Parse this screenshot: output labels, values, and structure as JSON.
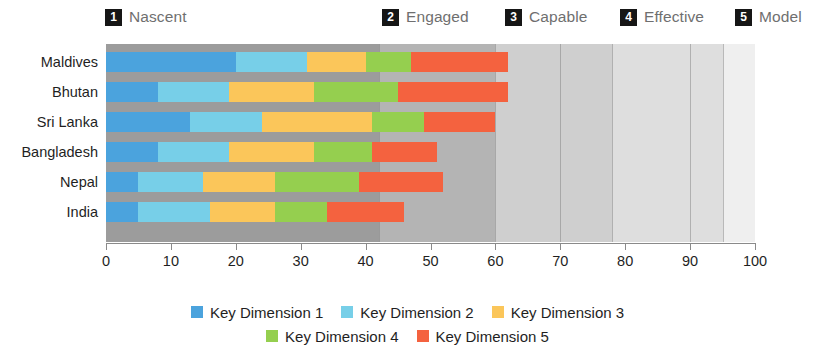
{
  "bands": [
    {
      "number": "1",
      "label": "Nascent",
      "x_px": 105
    },
    {
      "number": "2",
      "label": "Engaged",
      "x_px": 382
    },
    {
      "number": "3",
      "label": "Capable",
      "x_px": 505
    },
    {
      "number": "4",
      "label": "Effective",
      "x_px": 620
    },
    {
      "number": "5",
      "label": "Model",
      "x_px": 735
    }
  ],
  "legend": {
    "row1": [
      {
        "label": "Key Dimension 1",
        "color": "#4ba3dd"
      },
      {
        "label": "Key Dimension 2",
        "color": "#77cfe8"
      },
      {
        "label": "Key Dimension 3",
        "color": "#fbc65a"
      }
    ],
    "row2": [
      {
        "label": "Key Dimension 4",
        "color": "#95cf4f"
      },
      {
        "label": "Key Dimension 5",
        "color": "#f4623f"
      }
    ]
  },
  "chart_data": {
    "type": "bar",
    "orientation": "horizontal",
    "stacked": true,
    "title": "",
    "xlabel": "",
    "ylabel": "",
    "xlim": [
      0,
      100
    ],
    "xticks": [
      0,
      10,
      20,
      30,
      40,
      50,
      60,
      70,
      80,
      90,
      100
    ],
    "grid": false,
    "legend_position": "bottom",
    "categories": [
      "Maldives",
      "Bhutan",
      "Sri Lanka",
      "Bangladesh",
      "Nepal",
      "India"
    ],
    "series": [
      {
        "name": "Key Dimension 1",
        "color": "#4ba3dd",
        "values": [
          20,
          8,
          13,
          8,
          5,
          5
        ]
      },
      {
        "name": "Key Dimension 2",
        "color": "#77cfe8",
        "values": [
          11,
          11,
          11,
          11,
          10,
          11
        ]
      },
      {
        "name": "Key Dimension 3",
        "color": "#fbc65a",
        "values": [
          9,
          13,
          17,
          13,
          11,
          10
        ]
      },
      {
        "name": "Key Dimension 4",
        "color": "#95cf4f",
        "values": [
          7,
          13,
          8,
          9,
          13,
          8
        ]
      },
      {
        "name": "Key Dimension 5",
        "color": "#f4623f",
        "values": [
          15,
          17,
          11,
          10,
          13,
          12
        ]
      }
    ],
    "totals": [
      62,
      62,
      60,
      51,
      52,
      46
    ],
    "background_zones": [
      {
        "band": "1",
        "label": "Nascent",
        "from": 0,
        "to": 42,
        "color": "#9c9c9c"
      },
      {
        "band": "2",
        "label": "Engaged",
        "from": 42,
        "to": 60,
        "color": "#b4b4b4"
      },
      {
        "band": "3",
        "label": "Capable",
        "from": 60,
        "to": 78,
        "color": "#cfcfcf"
      },
      {
        "band": "4",
        "label": "Effective",
        "from": 78,
        "to": 95,
        "color": "#dedede"
      },
      {
        "band": "5",
        "label": "Model",
        "from": 95,
        "to": 100,
        "color": "#efefef"
      }
    ]
  }
}
